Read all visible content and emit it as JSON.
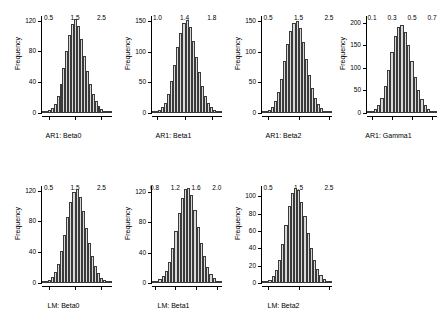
{
  "figure": {
    "background": "#ffffff",
    "bar_fill": "#d9d9d9",
    "bar_stroke": "#3a3a3a",
    "rows": 2,
    "cols": 4
  },
  "chart_data": [
    {
      "type": "bar",
      "title": "",
      "xlabel": "AR1: Beta0",
      "ylabel": "Frequency",
      "xlim": [
        0.25,
        2.9
      ],
      "ylim": [
        0,
        126
      ],
      "xticks": [
        0.5,
        1.5,
        2.5
      ],
      "xtick_labels": [
        "0.5",
        "1.5",
        "2.5"
      ],
      "yticks": [
        0,
        40,
        80,
        120
      ],
      "ytick_labels": [
        "0",
        "40",
        "80",
        "120"
      ],
      "bin_values": [
        1,
        2,
        4,
        7,
        12,
        22,
        38,
        58,
        80,
        101,
        116,
        122,
        113,
        96,
        74,
        55,
        38,
        25,
        16,
        9,
        5,
        3,
        2,
        1
      ]
    },
    {
      "type": "bar",
      "title": "",
      "xlabel": "AR1: Beta1",
      "ylabel": "Frequency",
      "xlim": [
        0.92,
        1.95
      ],
      "ylim": [
        0,
        158
      ],
      "xticks": [
        1.0,
        1.4,
        1.8
      ],
      "xtick_labels": [
        "1.0",
        "1.4",
        "1.8"
      ],
      "yticks": [
        0,
        50,
        100,
        150
      ],
      "ytick_labels": [
        "0",
        "50",
        "100",
        "150"
      ],
      "bin_values": [
        1,
        2,
        5,
        9,
        17,
        31,
        52,
        79,
        107,
        130,
        146,
        151,
        140,
        118,
        92,
        66,
        44,
        27,
        16,
        9,
        5,
        2,
        1
      ]
    },
    {
      "type": "bar",
      "title": "",
      "xlabel": "AR1: Beta2",
      "ylabel": "Frequency",
      "xlim": [
        0.3,
        2.6
      ],
      "ylim": [
        0,
        158
      ],
      "xticks": [
        0.5,
        1.5,
        2.5
      ],
      "xtick_labels": [
        "0.5",
        "1.5",
        "2.5"
      ],
      "yticks": [
        0,
        50,
        100,
        150
      ],
      "ytick_labels": [
        "0",
        "50",
        "100",
        "150"
      ],
      "bin_values": [
        1,
        2,
        5,
        10,
        19,
        34,
        56,
        84,
        112,
        133,
        147,
        150,
        138,
        115,
        88,
        62,
        41,
        25,
        15,
        8,
        4,
        2,
        1
      ]
    },
    {
      "type": "bar",
      "title": "",
      "xlabel": "AR1: Gamma1",
      "ylabel": "Frequency",
      "xlim": [
        0.05,
        0.75
      ],
      "ylim": [
        0,
        215
      ],
      "xticks": [
        0.1,
        0.3,
        0.5,
        0.7
      ],
      "xtick_labels": [
        "0.1",
        "0.3",
        "0.5",
        "0.7"
      ],
      "yticks": [
        0,
        50,
        100,
        150,
        200
      ],
      "ytick_labels": [
        "0",
        "50",
        "100",
        "150",
        "200"
      ],
      "bin_values": [
        2,
        4,
        9,
        18,
        34,
        60,
        96,
        136,
        170,
        190,
        196,
        180,
        150,
        115,
        80,
        52,
        31,
        17,
        9,
        4,
        2
      ]
    },
    {
      "type": "bar",
      "title": "",
      "xlabel": "LM: Beta0",
      "ylabel": "Frequency",
      "xlim": [
        0.25,
        2.9
      ],
      "ylim": [
        0,
        126
      ],
      "xticks": [
        0.5,
        1.5,
        2.5
      ],
      "xtick_labels": [
        "0.5",
        "1.5",
        "2.5"
      ],
      "yticks": [
        0,
        40,
        80,
        120
      ],
      "ytick_labels": [
        "0",
        "40",
        "80",
        "120"
      ],
      "bin_values": [
        1,
        2,
        4,
        8,
        14,
        25,
        42,
        63,
        86,
        105,
        118,
        122,
        112,
        94,
        72,
        52,
        35,
        22,
        13,
        7,
        4,
        2,
        1
      ]
    },
    {
      "type": "bar",
      "title": "",
      "xlabel": "LM: Beta1",
      "ylabel": "Frequency",
      "xlim": [
        0.75,
        2.1
      ],
      "ylim": [
        0,
        128
      ],
      "xticks": [
        0.8,
        1.2,
        1.6,
        2.0
      ],
      "xtick_labels": [
        "0.8",
        "1.2",
        "1.6",
        "2.0"
      ],
      "yticks": [
        0,
        40,
        80,
        120
      ],
      "ytick_labels": [
        "0",
        "40",
        "80",
        "120"
      ],
      "bin_values": [
        1,
        2,
        5,
        9,
        16,
        28,
        46,
        68,
        92,
        112,
        124,
        126,
        116,
        97,
        74,
        53,
        35,
        21,
        12,
        6,
        3,
        1
      ]
    },
    {
      "type": "bar",
      "title": "",
      "xlabel": "LM: Beta2",
      "ylabel": "Frequency",
      "xlim": [
        0.3,
        2.6
      ],
      "ylim": [
        0,
        112
      ],
      "xticks": [
        0.5,
        1.5,
        2.5
      ],
      "xtick_labels": [
        "0.5",
        "1.5",
        "2.5"
      ],
      "yticks": [
        0,
        20,
        40,
        60,
        80,
        100
      ],
      "ytick_labels": [
        "0",
        "20",
        "40",
        "60",
        "80",
        "100"
      ],
      "bin_values": [
        1,
        2,
        4,
        8,
        15,
        27,
        45,
        67,
        89,
        104,
        110,
        107,
        94,
        77,
        58,
        41,
        27,
        16,
        9,
        5,
        2,
        1
      ]
    }
  ]
}
